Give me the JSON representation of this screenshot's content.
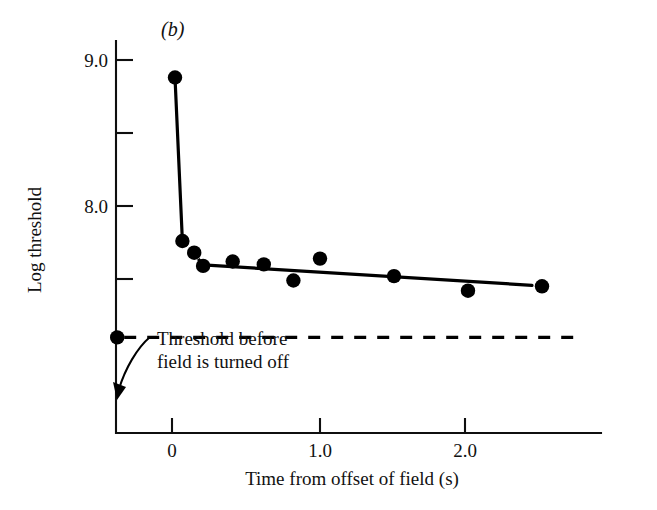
{
  "figure": {
    "panel_label": "(b)",
    "background_color": "#ffffff",
    "ink_color": "#000000"
  },
  "chart_data": {
    "type": "scatter",
    "title": "",
    "subtitle": "",
    "xlabel": "Time from offset of field (s)",
    "ylabel": "Log threshold",
    "xlim": [
      -0.6,
      2.9
    ],
    "ylim": [
      7.1,
      9.2
    ],
    "grid": false,
    "legend": null,
    "x_ticks": [
      {
        "value": 0,
        "label": "0"
      },
      {
        "value": 1.0,
        "label": "1.0"
      },
      {
        "value": 2.0,
        "label": "2.0"
      }
    ],
    "y_ticks": [
      {
        "value": 9.0,
        "label": "9.0"
      },
      {
        "value": 8.5,
        "label": ""
      },
      {
        "value": 8.0,
        "label": "8.0"
      },
      {
        "value": 7.5,
        "label": ""
      }
    ],
    "series": [
      {
        "name": "Threshold after field offset",
        "marker": "filled-circle",
        "x": [
          0.02,
          0.07,
          0.15,
          0.21,
          0.41,
          0.62,
          0.82,
          1.0,
          1.5,
          2.0,
          2.5
        ],
        "y": [
          8.88,
          7.76,
          7.68,
          7.59,
          7.62,
          7.6,
          7.49,
          7.64,
          7.52,
          7.42,
          7.45
        ]
      },
      {
        "name": "Threshold before field is turned off",
        "marker": "filled-circle",
        "x": [
          -0.37
        ],
        "y": [
          7.1
        ]
      }
    ],
    "annotations": [
      {
        "name": "baseline-threshold",
        "text": "Threshold before\nfield is turned off",
        "lines": [
          "Threshold before",
          "field is turned off"
        ],
        "points_to_x": -0.37,
        "points_to_y": 7.1
      }
    ]
  }
}
